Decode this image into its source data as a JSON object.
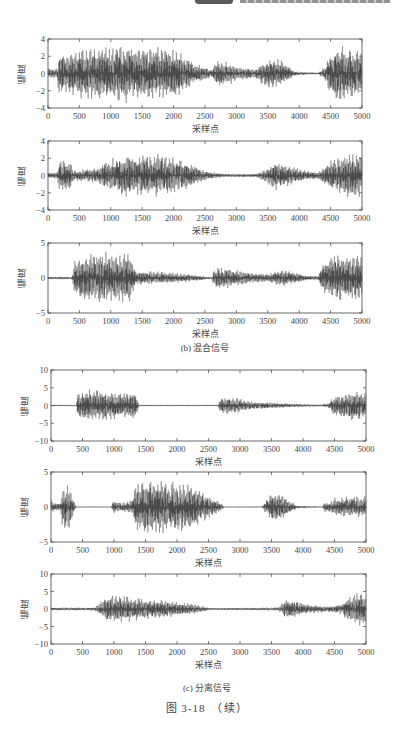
{
  "header": {
    "badge": "",
    "text": ""
  },
  "groups": [
    {
      "caption": "(b) 混合信号",
      "panel_indices": [
        0,
        1,
        2
      ]
    },
    {
      "caption": "(c) 分离信号",
      "panel_indices": [
        3,
        4,
        5
      ]
    }
  ],
  "figure_title": "图 3-18　（续）",
  "axis_text": {
    "ylabel": "幅度",
    "xlabel": "采样点"
  },
  "chart_data": [
    {
      "type": "line",
      "title": "混合信号 1",
      "group": "(b) 混合信号",
      "xlabel": "采样点",
      "ylabel": "幅度",
      "xlim": [
        0,
        5000
      ],
      "ylim": [
        -4,
        4
      ],
      "xticks": [
        0,
        500,
        1000,
        1500,
        2000,
        2500,
        3000,
        3500,
        4000,
        4500,
        5000
      ],
      "yticks": [
        -4,
        -2,
        0,
        2,
        4
      ],
      "envelope": {
        "x": [
          0,
          150,
          170,
          400,
          500,
          800,
          1000,
          1300,
          1500,
          1800,
          2000,
          2200,
          2300,
          2500,
          2600,
          2700,
          2900,
          3000,
          3300,
          3400,
          3500,
          3700,
          3900,
          4000,
          4300,
          4400,
          4500,
          4600,
          4800,
          5000
        ],
        "amp": [
          0.6,
          0.6,
          2.6,
          2.6,
          3.0,
          3.2,
          3.2,
          3.5,
          3.0,
          3.2,
          3.0,
          2.2,
          1.4,
          0.8,
          0.4,
          1.6,
          1.4,
          0.8,
          0.6,
          1.2,
          1.7,
          1.7,
          0.4,
          0.2,
          0.1,
          0.8,
          2.6,
          3.5,
          3.0,
          2.8
        ]
      },
      "layout": {
        "left": 48,
        "top": 39,
        "width": 314,
        "height": 69
      }
    },
    {
      "type": "line",
      "title": "混合信号 2",
      "group": "(b) 混合信号",
      "xlabel": "采样点",
      "ylabel": "幅度",
      "xlim": [
        0,
        5000
      ],
      "ylim": [
        -4,
        4
      ],
      "xticks": [
        0,
        500,
        1000,
        1500,
        2000,
        2500,
        3000,
        3500,
        4000,
        4500,
        5000
      ],
      "yticks": [
        -4,
        -2,
        0,
        2,
        4
      ],
      "envelope": {
        "x": [
          0,
          150,
          170,
          350,
          400,
          800,
          900,
          1000,
          1300,
          1500,
          1800,
          2000,
          2200,
          2400,
          2500,
          2800,
          3300,
          3500,
          3600,
          3800,
          4000,
          4300,
          4500,
          4700,
          4900,
          5000
        ],
        "amp": [
          0.4,
          0.4,
          1.8,
          1.8,
          0.6,
          1.0,
          1.6,
          2.0,
          2.6,
          2.4,
          2.5,
          2.2,
          1.6,
          1.0,
          0.6,
          0.2,
          0.2,
          0.9,
          1.8,
          1.3,
          0.8,
          0.4,
          1.8,
          2.4,
          2.8,
          2.5
        ]
      },
      "layout": {
        "left": 48,
        "top": 141,
        "width": 314,
        "height": 69
      }
    },
    {
      "type": "line",
      "title": "混合信号 3",
      "group": "(b) 混合信号",
      "xlabel": "采样点",
      "ylabel": "幅度",
      "xlim": [
        0,
        5000
      ],
      "ylim": [
        -5,
        5
      ],
      "xticks": [
        0,
        500,
        1000,
        1500,
        2000,
        2500,
        3000,
        3500,
        4000,
        4500,
        5000
      ],
      "yticks": [
        -5,
        0,
        5
      ],
      "envelope": {
        "x": [
          0,
          380,
          420,
          600,
          900,
          1100,
          1300,
          1400,
          1600,
          2000,
          2400,
          2600,
          2650,
          2700,
          2900,
          3200,
          3500,
          3700,
          3900,
          4100,
          4300,
          4400,
          4500,
          4800,
          5000
        ],
        "amp": [
          0.2,
          0.2,
          2.8,
          3.6,
          4.0,
          3.6,
          3.5,
          1.2,
          1.0,
          0.8,
          0.4,
          0.1,
          1.4,
          1.8,
          1.4,
          0.8,
          0.6,
          1.2,
          1.0,
          0.4,
          0.3,
          2.5,
          3.2,
          3.5,
          3.0
        ]
      },
      "layout": {
        "left": 48,
        "top": 243,
        "width": 314,
        "height": 70
      }
    },
    {
      "type": "line",
      "title": "分离信号 1",
      "group": "(c) 分离信号",
      "xlabel": "采样点",
      "ylabel": "幅度",
      "xlim": [
        0,
        5000
      ],
      "ylim": [
        -10,
        10
      ],
      "xticks": [
        0,
        500,
        1000,
        1500,
        2000,
        2500,
        3000,
        3500,
        4000,
        4500,
        5000
      ],
      "yticks": [
        -10,
        -5,
        0,
        5,
        10
      ],
      "envelope": {
        "x": [
          0,
          400,
          420,
          600,
          900,
          1100,
          1300,
          1350,
          1400,
          2600,
          2650,
          2700,
          2900,
          3200,
          3600,
          4000,
          4300,
          4400,
          4500,
          4800,
          5000
        ],
        "amp": [
          0.2,
          0.2,
          3.5,
          5.0,
          4.2,
          4.0,
          4.0,
          3.5,
          0.2,
          0.2,
          0.2,
          2.6,
          2.4,
          1.2,
          0.8,
          0.4,
          0.3,
          0.8,
          3.0,
          4.5,
          4.0
        ]
      },
      "layout": {
        "left": 51,
        "top": 370,
        "width": 315,
        "height": 71
      }
    },
    {
      "type": "line",
      "title": "分离信号 2",
      "group": "(c) 分离信号",
      "xlabel": "采样点",
      "ylabel": "幅度",
      "xlim": [
        0,
        5000
      ],
      "ylim": [
        -5,
        5
      ],
      "xticks": [
        0,
        500,
        1000,
        1500,
        2000,
        2500,
        3000,
        3500,
        4000,
        4500,
        5000
      ],
      "yticks": [
        -5,
        0,
        5
      ],
      "envelope": {
        "x": [
          0,
          80,
          150,
          180,
          300,
          360,
          400,
          950,
          1000,
          1100,
          1200,
          1300,
          1350,
          1600,
          2000,
          2200,
          2500,
          2700,
          2750,
          3350,
          3400,
          3500,
          3600,
          3800,
          3900,
          4300,
          4350,
          4400,
          4500,
          4700,
          5000
        ],
        "amp": [
          1.0,
          0.6,
          0.6,
          3.0,
          3.5,
          1.0,
          0.05,
          0.05,
          1.2,
          0.6,
          0.8,
          1.2,
          3.8,
          4.0,
          3.6,
          3.4,
          1.8,
          0.6,
          0.05,
          0.05,
          0.8,
          2.0,
          2.2,
          1.0,
          0.2,
          0.05,
          0.8,
          0.6,
          1.4,
          1.6,
          1.6
        ]
      },
      "layout": {
        "left": 51,
        "top": 472,
        "width": 315,
        "height": 70
      }
    },
    {
      "type": "line",
      "title": "分离信号 3",
      "group": "(c) 分离信号",
      "xlabel": "采样点",
      "ylabel": "幅度",
      "xlim": [
        0,
        5000
      ],
      "ylim": [
        -10,
        10
      ],
      "xticks": [
        0,
        500,
        1000,
        1500,
        2000,
        2500,
        3000,
        3500,
        4000,
        4500,
        5000
      ],
      "yticks": [
        -10,
        -5,
        0,
        5,
        10
      ],
      "envelope": {
        "x": [
          0,
          700,
          750,
          900,
          1200,
          1500,
          2000,
          2300,
          2500,
          2600,
          3300,
          3600,
          3650,
          3700,
          3900,
          4100,
          4400,
          4600,
          4700,
          4850,
          5000
        ],
        "amp": [
          0.4,
          0.5,
          1.5,
          4.0,
          3.8,
          3.0,
          2.2,
          1.4,
          0.4,
          0.3,
          0.4,
          0.5,
          1.2,
          2.6,
          2.4,
          1.2,
          0.8,
          1.5,
          3.5,
          5.0,
          5.0
        ]
      },
      "layout": {
        "left": 51,
        "top": 574,
        "width": 315,
        "height": 70
      }
    }
  ]
}
